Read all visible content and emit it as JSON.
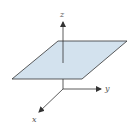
{
  "diagram": {
    "title": "",
    "type": "3d-coordinate-axes-with-plane",
    "axes": [
      {
        "name": "x",
        "label": "x"
      },
      {
        "name": "y",
        "label": "y"
      },
      {
        "name": "z",
        "label": "z"
      }
    ],
    "plane": {
      "fill": "#d3e2ee",
      "stroke": "#333333"
    },
    "colors": {
      "axis": "#333333",
      "label": "#555555"
    }
  }
}
